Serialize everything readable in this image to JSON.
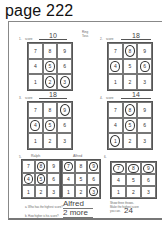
{
  "page_title": "page 222",
  "ring_toss_label": [
    "Ring",
    "Toss"
  ],
  "problems": [
    {
      "num": "1.",
      "score_label": "score",
      "score": "10",
      "grid": [
        [
          "7",
          "8",
          "9"
        ],
        [
          "4",
          "5",
          "6"
        ],
        [
          "1",
          "2",
          "3"
        ]
      ],
      "circled": [
        "5",
        "2",
        "3"
      ]
    },
    {
      "num": "2.",
      "score_label": "score",
      "score": "18",
      "grid": [
        [
          "7",
          "8",
          "9"
        ],
        [
          "4",
          "5",
          "6"
        ],
        [
          "1",
          "2",
          "3"
        ]
      ],
      "circled": [
        "8",
        "4",
        "6"
      ]
    },
    {
      "num": "3.",
      "score_label": "score",
      "score": "18",
      "grid": [
        [
          "7",
          "8",
          "9"
        ],
        [
          "4",
          "5",
          "6"
        ],
        [
          "1",
          "2",
          "3"
        ]
      ],
      "circled": [
        "9",
        "4",
        "5"
      ]
    },
    {
      "num": "4.",
      "score_label": "score",
      "score": "14",
      "grid": [
        [
          "7",
          "8",
          "9"
        ],
        [
          "4",
          "5",
          "6"
        ],
        [
          "1",
          "2",
          "3"
        ]
      ],
      "circled": [
        "8",
        "5",
        "1"
      ]
    }
  ],
  "problem5": {
    "num": "5.",
    "players": [
      {
        "name": "Ralph",
        "grid": [
          [
            "7",
            "8",
            "9"
          ],
          [
            "4",
            "5",
            "6"
          ],
          [
            "1",
            "2",
            "3"
          ]
        ],
        "circled": [
          "8",
          "4",
          "5"
        ]
      },
      {
        "name": "Alfred",
        "grid": [
          [
            "7",
            "8",
            "9"
          ],
          [
            "4",
            "5",
            "6"
          ],
          [
            "1",
            "2",
            "3"
          ]
        ],
        "circled": [
          "7",
          "9",
          "3"
        ]
      }
    ],
    "question_a": "a. Who has the highest score?",
    "answer_a": "Alfred",
    "question_b": "b. How higher is his score?",
    "answer_b": "2 more"
  },
  "problem6": {
    "num": "6.",
    "grid": [
      [
        "7",
        "8",
        "9"
      ],
      [
        "4",
        "5",
        "6"
      ],
      [
        "1",
        "2",
        "3"
      ]
    ],
    "circled": [
      "7",
      "8",
      "9"
    ],
    "instruction_lines": [
      "Show three throws.",
      "Make the highest score",
      "you can."
    ],
    "answer": "24"
  }
}
